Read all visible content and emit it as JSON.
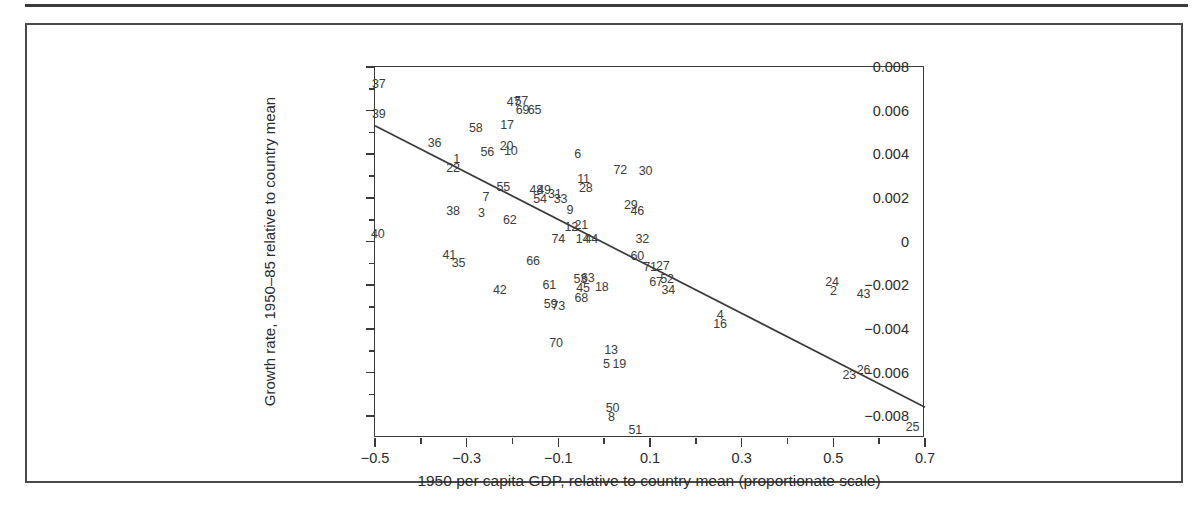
{
  "figure": {
    "has_top_rule": true,
    "has_outer_frame": true,
    "line_color": "#3a3a3a",
    "text_color": "#2b2b2b",
    "point_label_color": "#3c3c3c"
  },
  "chart_data": {
    "type": "scatter",
    "title": "",
    "subtitle": "",
    "xlabel": "1950 per capita GDP, relative to country mean (proportionate scale)",
    "ylabel": "Growth rate, 1950–85 relative to country mean",
    "xlim": [
      -0.5,
      0.7
    ],
    "ylim": [
      -0.009,
      0.008
    ],
    "grid": false,
    "legend": null,
    "xticks": [
      -0.5,
      -0.3,
      -0.1,
      0.1,
      0.3,
      0.5,
      0.7
    ],
    "xticklabels": [
      "−0.5",
      "−0.3",
      "−0.1",
      "0.1",
      "0.3",
      "0.5",
      "0.7"
    ],
    "xminorticks": [
      -0.4,
      -0.2,
      0.0,
      0.2,
      0.4,
      0.6
    ],
    "yticks": [
      0.008,
      0.006,
      0.004,
      0.002,
      0,
      -0.002,
      -0.004,
      -0.006,
      -0.008
    ],
    "yticklabels": [
      "0.008",
      "0.006",
      "0.004",
      "0.002",
      "0",
      "−0.002",
      "−0.004",
      "−0.006",
      "−0.008"
    ],
    "yminorticks": [
      0.007,
      0.005,
      0.003,
      0.001,
      -0.001,
      -0.003,
      -0.005,
      -0.007
    ],
    "marker_style": "numeric-label",
    "fit_line": {
      "label": "regression line",
      "x_start": -0.5,
      "y_start": 0.00531,
      "x_end": 0.7,
      "y_end": -0.00759
    },
    "points": [
      {
        "label": "37",
        "x": -0.492,
        "y": 0.00723
      },
      {
        "label": "39",
        "x": -0.492,
        "y": 0.00586
      },
      {
        "label": "40",
        "x": -0.494,
        "y": 0.00034
      },
      {
        "label": "36",
        "x": -0.37,
        "y": 0.00452
      },
      {
        "label": "1",
        "x": -0.322,
        "y": 0.0038
      },
      {
        "label": "22",
        "x": -0.33,
        "y": 0.00338
      },
      {
        "label": "38",
        "x": -0.33,
        "y": 0.0014
      },
      {
        "label": "41",
        "x": -0.338,
        "y": -0.00062
      },
      {
        "label": "35",
        "x": -0.318,
        "y": -0.00098
      },
      {
        "label": "58",
        "x": -0.28,
        "y": 0.0052
      },
      {
        "label": "56",
        "x": -0.255,
        "y": 0.00412
      },
      {
        "label": "3",
        "x": -0.268,
        "y": 0.00131
      },
      {
        "label": "7",
        "x": -0.258,
        "y": 0.00205
      },
      {
        "label": "55",
        "x": -0.22,
        "y": 0.00251
      },
      {
        "label": "17",
        "x": -0.212,
        "y": 0.00533
      },
      {
        "label": "47",
        "x": -0.198,
        "y": 0.0064
      },
      {
        "label": "20",
        "x": -0.213,
        "y": 0.00437
      },
      {
        "label": "10",
        "x": -0.204,
        "y": 0.00414
      },
      {
        "label": "57",
        "x": -0.181,
        "y": 0.00645
      },
      {
        "label": "69",
        "x": -0.178,
        "y": 0.00605
      },
      {
        "label": "65",
        "x": -0.152,
        "y": 0.00602
      },
      {
        "label": "62",
        "x": -0.206,
        "y": 0.001
      },
      {
        "label": "42",
        "x": -0.228,
        "y": -0.0022
      },
      {
        "label": "48",
        "x": -0.148,
        "y": 0.00235
      },
      {
        "label": "49",
        "x": -0.131,
        "y": 0.00235
      },
      {
        "label": "54",
        "x": -0.14,
        "y": 0.00194
      },
      {
        "label": "31",
        "x": -0.108,
        "y": 0.00217
      },
      {
        "label": "33",
        "x": -0.095,
        "y": 0.00196
      },
      {
        "label": "66",
        "x": -0.155,
        "y": -0.00087
      },
      {
        "label": "74",
        "x": -0.1,
        "y": 0.0001
      },
      {
        "label": "61",
        "x": -0.12,
        "y": -0.00199
      },
      {
        "label": "59",
        "x": -0.117,
        "y": -0.00284
      },
      {
        "label": "73",
        "x": -0.1,
        "y": -0.00296
      },
      {
        "label": "70",
        "x": -0.105,
        "y": -0.00466
      },
      {
        "label": "6",
        "x": -0.058,
        "y": 0.004
      },
      {
        "label": "11",
        "x": -0.045,
        "y": 0.00289
      },
      {
        "label": "28",
        "x": -0.04,
        "y": 0.00245
      },
      {
        "label": "9",
        "x": -0.075,
        "y": 0.00146
      },
      {
        "label": "12",
        "x": -0.072,
        "y": 0.00069
      },
      {
        "label": "21",
        "x": -0.05,
        "y": 0.00077
      },
      {
        "label": "14",
        "x": -0.047,
        "y": 0.00011
      },
      {
        "label": "44",
        "x": -0.028,
        "y": 0.00011
      },
      {
        "label": "53",
        "x": -0.052,
        "y": -0.00171
      },
      {
        "label": "63",
        "x": -0.036,
        "y": -0.00165
      },
      {
        "label": "45",
        "x": -0.046,
        "y": -0.00212
      },
      {
        "label": "68",
        "x": -0.05,
        "y": -0.00258
      },
      {
        "label": "18",
        "x": -0.005,
        "y": -0.00208
      },
      {
        "label": "13",
        "x": 0.015,
        "y": -0.00496
      },
      {
        "label": "5",
        "x": 0.005,
        "y": -0.00559
      },
      {
        "label": "19",
        "x": 0.033,
        "y": -0.00559
      },
      {
        "label": "50",
        "x": 0.018,
        "y": -0.00764
      },
      {
        "label": "8",
        "x": 0.016,
        "y": -0.00806
      },
      {
        "label": "51",
        "x": 0.068,
        "y": -0.00862
      },
      {
        "label": "72",
        "x": 0.035,
        "y": 0.00327
      },
      {
        "label": "30",
        "x": 0.09,
        "y": 0.00325
      },
      {
        "label": "29",
        "x": 0.058,
        "y": 0.00166
      },
      {
        "label": "46",
        "x": 0.072,
        "y": 0.00138
      },
      {
        "label": "32",
        "x": 0.083,
        "y": 0.00014
      },
      {
        "label": "60",
        "x": 0.072,
        "y": -0.00065
      },
      {
        "label": "71",
        "x": 0.1,
        "y": -0.00116
      },
      {
        "label": "27",
        "x": 0.128,
        "y": -0.00114
      },
      {
        "label": "67",
        "x": 0.113,
        "y": -0.00187
      },
      {
        "label": "52",
        "x": 0.137,
        "y": -0.00172
      },
      {
        "label": "34",
        "x": 0.14,
        "y": -0.00221
      },
      {
        "label": "4",
        "x": 0.253,
        "y": -0.00335
      },
      {
        "label": "16",
        "x": 0.253,
        "y": -0.00376
      },
      {
        "label": "24",
        "x": 0.497,
        "y": -0.00184
      },
      {
        "label": "2",
        "x": 0.5,
        "y": -0.00226
      },
      {
        "label": "43",
        "x": 0.566,
        "y": -0.00242
      },
      {
        "label": "23",
        "x": 0.535,
        "y": -0.00613
      },
      {
        "label": "26",
        "x": 0.566,
        "y": -0.00589
      },
      {
        "label": "25",
        "x": 0.673,
        "y": -0.00851
      }
    ]
  }
}
